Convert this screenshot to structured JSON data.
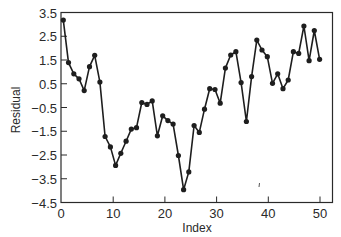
{
  "chart_data": {
    "type": "line",
    "title": "",
    "xlabel": "Index",
    "ylabel": "Residual",
    "xlim": [
      0,
      52
    ],
    "ylim": [
      -4.5,
      3.5
    ],
    "xticks": [
      0,
      10,
      20,
      30,
      40,
      50
    ],
    "yticks": [
      3.5,
      2.5,
      1.5,
      0.5,
      -0.5,
      -1.5,
      -2.5,
      -3.5,
      -4.5
    ],
    "ytick_labels": [
      "3.5",
      "2.5",
      "1.5",
      "0.5",
      "−0.5",
      "−1.5",
      "−2.5",
      "−3.5",
      "−4.5"
    ],
    "grid": false,
    "legend": null,
    "markers": true,
    "x": [
      1,
      2,
      3,
      4,
      5,
      6,
      7,
      8,
      9,
      10,
      11,
      12,
      13,
      14,
      15,
      16,
      17,
      18,
      19,
      20,
      21,
      22,
      23,
      24,
      25,
      26,
      27,
      28,
      29,
      30,
      31,
      32,
      33,
      34,
      35,
      36,
      37,
      38,
      39,
      40,
      41,
      42,
      43,
      44,
      45,
      46,
      47,
      48,
      49,
      50
    ],
    "series": [
      {
        "name": "Residual",
        "values": [
          3.18,
          1.39,
          0.92,
          0.71,
          0.21,
          1.22,
          1.7,
          0.57,
          -1.72,
          -2.16,
          -2.94,
          -2.43,
          -1.92,
          -1.41,
          -1.35,
          -0.29,
          -0.37,
          -0.22,
          -1.69,
          -0.85,
          -1.05,
          -1.2,
          -2.52,
          -3.96,
          -3.21,
          -1.26,
          -1.55,
          -0.57,
          0.29,
          0.26,
          -0.32,
          1.16,
          1.71,
          1.85,
          0.55,
          -1.09,
          0.8,
          2.34,
          1.92,
          1.64,
          0.52,
          0.92,
          0.29,
          0.66,
          1.85,
          1.78,
          2.93,
          1.47,
          2.74,
          1.53
        ]
      }
    ]
  },
  "colors": {
    "line": "#1e1e1e",
    "axis": "#2a2a2a",
    "background": "#ffffff"
  }
}
